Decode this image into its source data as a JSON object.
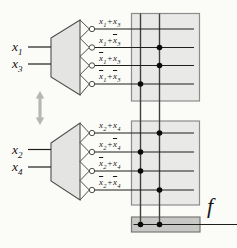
{
  "colors": {
    "plane_fill": "#e9e9e7",
    "plane_border": "#8c8c8c",
    "output_bar_fill": "#c8c8c6",
    "output_bar_border": "#787876",
    "decoder_fill": "#e4e4e2",
    "wire": "#1f1f1f",
    "vertical_wire": "#3f3f3f",
    "dot": "#0a0a0a",
    "arrow": "#b6b6b4",
    "background": "#fbfbf8"
  },
  "icons": {
    "swap": "double-headed-vertical-arrow"
  },
  "output": {
    "label": "f"
  },
  "output_bar": {
    "connects": [
      "left",
      "right"
    ]
  },
  "planes": [
    {
      "inputs": [
        {
          "base": "x",
          "sub": "1"
        },
        {
          "base": "x",
          "sub": "3"
        }
      ],
      "rows": [
        {
          "term": [
            {
              "base": "x",
              "sub": "1",
              "bar": false
            },
            {
              "base": "x",
              "sub": "3",
              "bar": false
            }
          ],
          "op": "+",
          "connect": "none"
        },
        {
          "term": [
            {
              "base": "x",
              "sub": "1",
              "bar": false
            },
            {
              "base": "x",
              "sub": "3",
              "bar": true
            }
          ],
          "op": "+",
          "connect": "right"
        },
        {
          "term": [
            {
              "base": "x",
              "sub": "1",
              "bar": true
            },
            {
              "base": "x",
              "sub": "3",
              "bar": false
            }
          ],
          "op": "+",
          "connect": "right"
        },
        {
          "term": [
            {
              "base": "x",
              "sub": "1",
              "bar": true
            },
            {
              "base": "x",
              "sub": "3",
              "bar": true
            }
          ],
          "op": "+",
          "connect": "left"
        }
      ]
    },
    {
      "inputs": [
        {
          "base": "x",
          "sub": "2"
        },
        {
          "base": "x",
          "sub": "4"
        }
      ],
      "rows": [
        {
          "term": [
            {
              "base": "x",
              "sub": "2",
              "bar": false
            },
            {
              "base": "x",
              "sub": "4",
              "bar": false
            }
          ],
          "op": "+",
          "connect": "right"
        },
        {
          "term": [
            {
              "base": "x",
              "sub": "2",
              "bar": false
            },
            {
              "base": "x",
              "sub": "4",
              "bar": true
            }
          ],
          "op": "+",
          "connect": "left"
        },
        {
          "term": [
            {
              "base": "x",
              "sub": "2",
              "bar": true
            },
            {
              "base": "x",
              "sub": "4",
              "bar": false
            }
          ],
          "op": "+",
          "connect": "left"
        },
        {
          "term": [
            {
              "base": "x",
              "sub": "2",
              "bar": true
            },
            {
              "base": "x",
              "sub": "4",
              "bar": true
            }
          ],
          "op": "+",
          "connect": "right"
        }
      ]
    }
  ]
}
